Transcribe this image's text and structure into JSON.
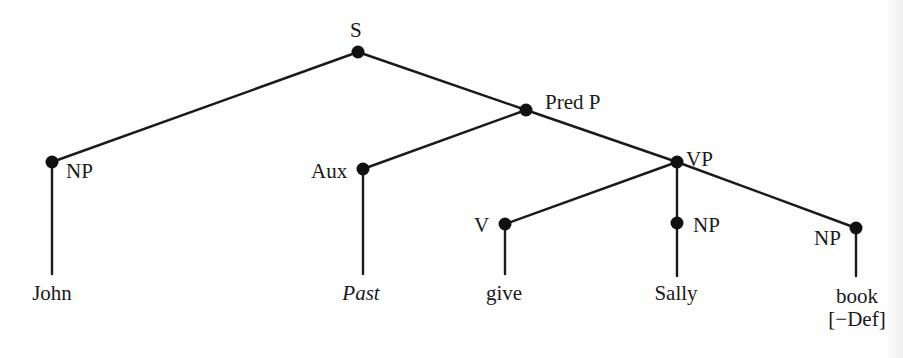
{
  "diagram": {
    "type": "syntax-tree",
    "colors": {
      "line": "#1a1a1a",
      "node": "#111111",
      "text": "#1a1a1a",
      "background": "#fefefe"
    },
    "nodes": [
      {
        "id": "S",
        "label": "S",
        "x": 358,
        "y": 52
      },
      {
        "id": "NP1",
        "label": "NP",
        "x": 52,
        "y": 162
      },
      {
        "id": "PredP",
        "label": "Pred P",
        "x": 526,
        "y": 110
      },
      {
        "id": "Aux",
        "label": "Aux",
        "x": 363,
        "y": 169
      },
      {
        "id": "VP",
        "label": "VP",
        "x": 677,
        "y": 162
      },
      {
        "id": "V",
        "label": "V",
        "x": 505,
        "y": 224
      },
      {
        "id": "NP2",
        "label": "NP",
        "x": 677,
        "y": 223
      },
      {
        "id": "NP3",
        "label": "NP",
        "x": 856,
        "y": 228
      }
    ],
    "edges": [
      [
        "S",
        "NP1"
      ],
      [
        "S",
        "PredP"
      ],
      [
        "PredP",
        "Aux"
      ],
      [
        "PredP",
        "VP"
      ],
      [
        "VP",
        "V"
      ],
      [
        "VP",
        "NP2"
      ],
      [
        "VP",
        "NP3"
      ]
    ],
    "leaves": [
      {
        "parent": "NP1",
        "text": "John",
        "italic": false
      },
      {
        "parent": "Aux",
        "text": "Past",
        "italic": true
      },
      {
        "parent": "V",
        "text": "give",
        "italic": false
      },
      {
        "parent": "NP2",
        "text": "Sally",
        "italic": false
      },
      {
        "parent": "NP3",
        "text": "book",
        "feature": "[−Def]",
        "italic": false
      }
    ]
  },
  "labels": {
    "s": "S",
    "np_john": "NP",
    "pred_p": "Pred P",
    "aux": "Aux",
    "vp": "VP",
    "v": "V",
    "np_sally": "NP",
    "np_book": "NP"
  },
  "words": {
    "john": "John",
    "past": "Past",
    "give": "give",
    "sally": "Sally",
    "book": "book",
    "book_feature": "[−Def]"
  }
}
